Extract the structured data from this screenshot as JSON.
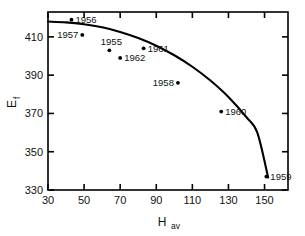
{
  "chart_data": {
    "type": "scatter",
    "title": "",
    "subtitle": "",
    "xlabel": "H",
    "xlabel_sub": "av",
    "ylabel": "E",
    "ylabel_sub": "f",
    "xlim": [
      30,
      163
    ],
    "ylim": [
      330,
      423
    ],
    "grid": false,
    "legend": "none",
    "xticks": [
      30,
      50,
      70,
      90,
      110,
      130,
      150
    ],
    "xtick_labels": [
      "30",
      "50",
      "70",
      "90",
      "110",
      "130",
      "150"
    ],
    "yticks": [
      330,
      350,
      370,
      390,
      410
    ],
    "ytick_labels": [
      "330",
      "350",
      "370",
      "390",
      "410"
    ],
    "points": [
      {
        "label": "1956",
        "x": 43,
        "y": 419,
        "label_side": "right"
      },
      {
        "label": "1957",
        "x": 49,
        "y": 411,
        "label_side": "left"
      },
      {
        "label": "1955",
        "x": 64,
        "y": 403,
        "label_side": "above-left"
      },
      {
        "label": "1962",
        "x": 70,
        "y": 399,
        "label_side": "right"
      },
      {
        "label": "1961",
        "x": 83,
        "y": 404,
        "label_side": "right"
      },
      {
        "label": "1958",
        "x": 102,
        "y": 386,
        "label_side": "left"
      },
      {
        "label": "1960",
        "x": 126,
        "y": 371,
        "label_side": "right"
      },
      {
        "label": "1959",
        "x": 151,
        "y": 337,
        "label_side": "right"
      }
    ],
    "curve": [
      {
        "x": 30,
        "y": 418
      },
      {
        "x": 40,
        "y": 417.6
      },
      {
        "x": 50,
        "y": 416.6
      },
      {
        "x": 60,
        "y": 415.0
      },
      {
        "x": 70,
        "y": 412.6
      },
      {
        "x": 80,
        "y": 409.4
      },
      {
        "x": 90,
        "y": 405.4
      },
      {
        "x": 100,
        "y": 400.4
      },
      {
        "x": 110,
        "y": 394.4
      },
      {
        "x": 120,
        "y": 387.2
      },
      {
        "x": 130,
        "y": 378.6
      },
      {
        "x": 140,
        "y": 368.0
      },
      {
        "x": 146,
        "y": 360.0
      },
      {
        "x": 152,
        "y": 336.5
      }
    ]
  },
  "style": {
    "line_color": "#000000",
    "marker_color": "#000000",
    "axis_color": "#000000",
    "background": "#ffffff"
  }
}
